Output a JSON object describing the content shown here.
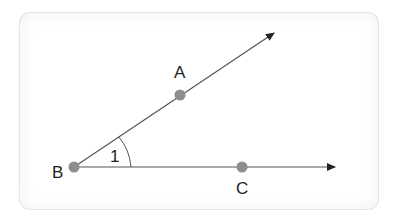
{
  "diagram": {
    "points": [
      {
        "id": "A",
        "label": "A",
        "x": 180,
        "y": 95
      },
      {
        "id": "B",
        "label": "B",
        "x": 74,
        "y": 167
      },
      {
        "id": "C",
        "label": "C",
        "x": 242,
        "y": 167
      }
    ],
    "rays": [
      {
        "from": "B",
        "through": "A",
        "arrow_tip": [
          275,
          32
        ]
      },
      {
        "from": "B",
        "through": "C",
        "arrow_tip": [
          336,
          167
        ]
      }
    ],
    "angle": {
      "vertex": "B",
      "label": "1"
    },
    "colors": {
      "line": "#555555",
      "point": "#8e8e8e",
      "text": "#222222"
    }
  }
}
